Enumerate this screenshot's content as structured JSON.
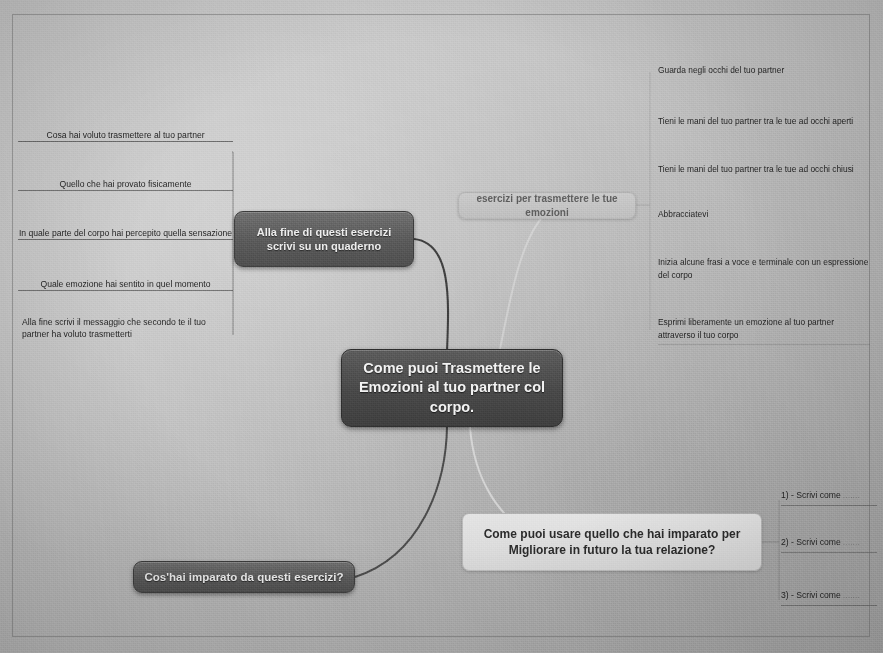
{
  "mindmap": {
    "central": {
      "line1": "Come puoi Trasmettere le",
      "line2": "Emozioni al tuo partner col corpo."
    },
    "branches": {
      "quaderno": {
        "title": "Alla fine di questi esercizi scrivi su un quaderno",
        "items": [
          "Cosa hai voluto trasmettere al tuo partner",
          "Quello che hai provato fisicamente",
          "In quale parte del corpo hai percepito quella sensazione",
          "Quale emozione hai sentito in quel momento",
          "Alla fine scrivi il messaggio che secondo te il tuo partner ha voluto trasmetterti"
        ]
      },
      "esercizi": {
        "title": "esercizi per trasmettere le tue emozioni",
        "items": [
          "Guarda negli occhi del tuo partner",
          "Tieni le mani del tuo partner tra le tue ad occhi aperti",
          "Tieni le mani del tuo partner tra le tue ad occhi chiusi",
          "Abbracciatevi",
          "Inizia alcune frasi a voce e terminale con un espressione del corpo",
          "Esprimi liberamente un emozione al tuo partner attraverso il tuo corpo"
        ]
      },
      "migliorare": {
        "line1": "Come puoi usare quello che hai imparato per",
        "line2": "Migliorare in futuro la tua relazione?",
        "items": [
          {
            "label": "1) - Scrivi come",
            "dots": "......."
          },
          {
            "label": "2) - Scrivi come",
            "dots": "......."
          },
          {
            "label": "3) - Scrivi come",
            "dots": "......."
          }
        ]
      },
      "imparato": {
        "title": "Cos'hai imparato da questi esercizi?"
      }
    }
  }
}
